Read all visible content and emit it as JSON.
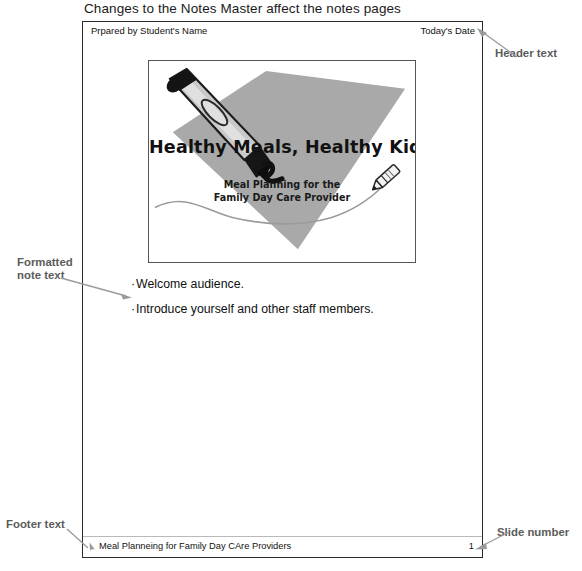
{
  "figure": {
    "caption": "Changes to the Notes Master affect the notes pages"
  },
  "notes_page": {
    "header": {
      "left_text": "Prpared by Student's Name",
      "right_text": "Today's Date"
    },
    "slide": {
      "title": "Healthy Meals, Healthy Kids",
      "subtitle_line1": "Meal Planning for the",
      "subtitle_line2": "Family Day Care Provider",
      "art": {
        "paper_color": "#a9a9a9",
        "marker_body_color": "#c7c7c7",
        "marker_cap_color": "#1c1c1c",
        "squiggle_color": "#1c1c1c",
        "wave_color": "#9a9a9a",
        "pencil_outline_color": "#2a2a2a"
      }
    },
    "notes": [
      {
        "bullet": "·",
        "text": "Welcome audience."
      },
      {
        "bullet": "·",
        "text": "Introduce yourself and other staff members."
      }
    ],
    "footer": {
      "left_text": "Meal Planneing for Family Day CAre Providers",
      "slide_number": "1"
    }
  },
  "callouts": {
    "header_text": "Header text",
    "formatted_note_text_line1": "Formatted",
    "formatted_note_text_line2": "note text",
    "footer_text": "Footer text",
    "slide_number": "Slide number",
    "line_color": "#9a9a9a",
    "label_color": "#5b5b5b"
  }
}
